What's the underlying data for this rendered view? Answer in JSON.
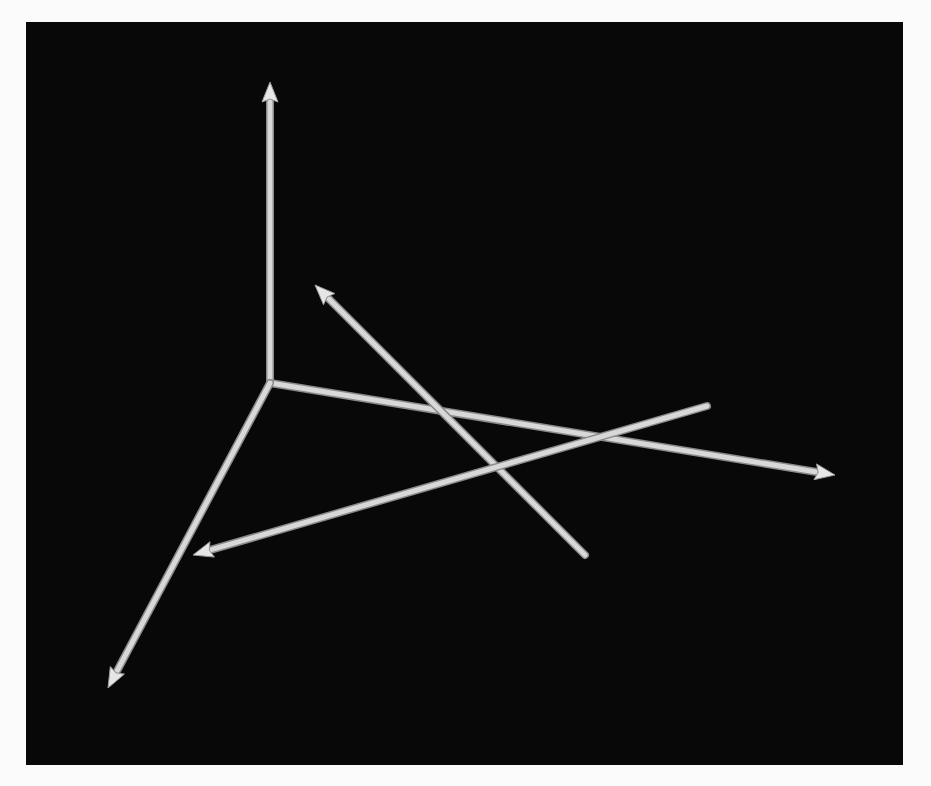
{
  "figure": {
    "background_color": "#080808",
    "page_color": "#fbfbfb",
    "stroke_color": "#d8d8d8"
  },
  "axes": [
    {
      "name": "z-axis",
      "from": [
        270,
        383
      ],
      "to": [
        270,
        82
      ],
      "arrow": true
    },
    {
      "name": "x-axis",
      "from": [
        270,
        383
      ],
      "to": [
        835,
        475
      ],
      "arrow": true
    },
    {
      "name": "y-axis",
      "from": [
        270,
        383
      ],
      "to": [
        108,
        688
      ],
      "arrow": true
    }
  ],
  "vectors": [
    {
      "name": "vector-a",
      "from": [
        585,
        555
      ],
      "to": [
        315,
        285
      ],
      "arrow": true
    },
    {
      "name": "vector-b",
      "from": [
        707,
        406
      ],
      "to": [
        193,
        555
      ],
      "arrow": true
    }
  ]
}
